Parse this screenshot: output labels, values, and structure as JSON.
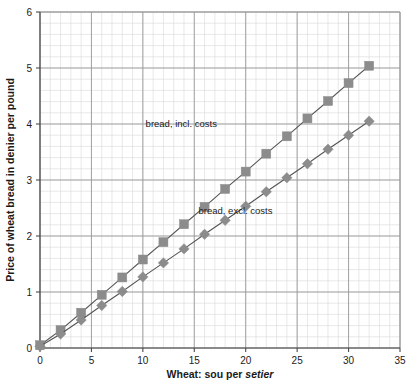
{
  "chart_data": {
    "type": "line",
    "title": "",
    "xlabel": "Wheat: sou per setier",
    "xlabel_plain": "Wheat: sou per ",
    "xlabel_italic": "setier",
    "ylabel": "Price of wheat bread in denier per pound",
    "xlim": [
      0,
      35
    ],
    "ylim": [
      0,
      6
    ],
    "xticks": [
      0,
      5,
      10,
      15,
      20,
      25,
      30,
      35
    ],
    "yticks": [
      0,
      1,
      2,
      3,
      4,
      5,
      6
    ],
    "xtick_labels": [
      "0",
      "5",
      "10",
      "15",
      "20",
      "25",
      "30",
      "35"
    ],
    "ytick_labels": [
      "0",
      "1",
      "2",
      "3",
      "4",
      "5",
      "6"
    ],
    "x_minor_step": 1,
    "y_minor_step": 0.2,
    "grid": true,
    "grid_major_color": "#9a9a9a",
    "grid_minor_color": "#d8d8d8",
    "legend": "annotations",
    "x": [
      0,
      2,
      4,
      6,
      8,
      10,
      12,
      14,
      16,
      18,
      20,
      22,
      24,
      26,
      28,
      30,
      32
    ],
    "series": [
      {
        "name": "bread, incl. costs",
        "marker": "square",
        "color": "#8c8c8c",
        "line_color": "#555555",
        "values": [
          0.05,
          0.32,
          0.63,
          0.95,
          1.26,
          1.58,
          1.89,
          2.21,
          2.52,
          2.84,
          3.15,
          3.47,
          3.78,
          4.1,
          4.41,
          4.73,
          5.04
        ],
        "annotation": {
          "text": "bread, incl. costs",
          "x": 17.2,
          "y": 3.95
        }
      },
      {
        "name": "bread, excl. costs",
        "marker": "diamond",
        "color": "#8c8c8c",
        "line_color": "#555555",
        "values": [
          0.03,
          0.25,
          0.5,
          0.76,
          1.01,
          1.27,
          1.52,
          1.77,
          2.03,
          2.28,
          2.53,
          2.79,
          3.04,
          3.29,
          3.55,
          3.8,
          4.05
        ],
        "annotation": {
          "text": "bread, excl. costs",
          "x": 22.6,
          "y": 2.4
        }
      }
    ]
  }
}
